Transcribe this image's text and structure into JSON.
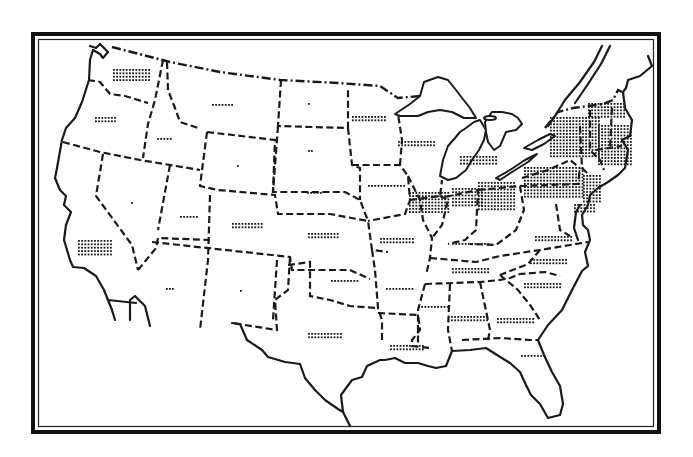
{
  "map": {
    "title": "",
    "type": "dot-density",
    "subject": "United States, state boundaries with dot-density shading",
    "colors": {
      "ink": "#1a1a1a",
      "paper": "#ffffff"
    },
    "frame": {
      "outer": [
        32,
        33,
        628,
        400
      ],
      "inner": [
        38,
        39,
        616,
        388
      ]
    },
    "states": [
      {
        "id": "WA",
        "name": "Washington",
        "density": "medium",
        "dots": [
          [
            113,
            69,
            12,
            4,
            3.2,
            3.4
          ]
        ]
      },
      {
        "id": "OR",
        "name": "Oregon",
        "density": "low",
        "dots": [
          [
            95,
            117,
            7,
            2,
            3.2,
            3.4
          ]
        ]
      },
      {
        "id": "ID",
        "name": "Idaho",
        "density": "very-low",
        "dots": [
          [
            157,
            138,
            5,
            1,
            3.2,
            3
          ]
        ]
      },
      {
        "id": "MT",
        "name": "Montana",
        "density": "very-low",
        "dots": [
          [
            212,
            104,
            7,
            1,
            3.2,
            3
          ]
        ]
      },
      {
        "id": "ND",
        "name": "North Dakota",
        "density": "trace",
        "dots": [
          [
            308,
            103,
            1,
            1,
            3,
            3
          ]
        ]
      },
      {
        "id": "WY",
        "name": "Wyoming",
        "density": "trace",
        "dots": [
          [
            237,
            165,
            1,
            1,
            3,
            3
          ]
        ]
      },
      {
        "id": "SD",
        "name": "South Dakota",
        "density": "trace",
        "dots": [
          [
            308,
            150,
            2,
            1,
            3,
            3
          ]
        ]
      },
      {
        "id": "NV",
        "name": "Nevada",
        "density": "trace",
        "dots": [
          [
            131,
            202,
            1,
            1,
            3,
            3
          ]
        ]
      },
      {
        "id": "UT",
        "name": "Utah",
        "density": "very-low",
        "dots": [
          [
            180,
            216,
            6,
            1,
            3.2,
            3
          ]
        ]
      },
      {
        "id": "CO",
        "name": "Colorado",
        "density": "low",
        "dots": [
          [
            232,
            223,
            10,
            2,
            3.2,
            3.4
          ]
        ]
      },
      {
        "id": "NE",
        "name": "Nebraska",
        "density": "very-low",
        "dots": [
          [
            307,
            192,
            5,
            1,
            3.2,
            3
          ]
        ]
      },
      {
        "id": "KS",
        "name": "Kansas",
        "density": "low",
        "dots": [
          [
            308,
            233,
            10,
            2,
            3.2,
            3.4
          ]
        ]
      },
      {
        "id": "CA",
        "name": "California",
        "density": "medium",
        "dots": [
          [
            78,
            240,
            11,
            5,
            3.2,
            3.4
          ]
        ]
      },
      {
        "id": "AZ",
        "name": "Arizona",
        "density": "trace",
        "dots": [
          [
            166,
            288,
            3,
            1,
            3,
            3
          ]
        ]
      },
      {
        "id": "NM",
        "name": "New Mexico",
        "density": "trace",
        "dots": [
          [
            240,
            290,
            1,
            1,
            3,
            3
          ]
        ]
      },
      {
        "id": "OK",
        "name": "Oklahoma",
        "density": "very-low",
        "dots": [
          [
            331,
            280,
            9,
            1,
            3.2,
            3
          ]
        ]
      },
      {
        "id": "TX",
        "name": "Texas",
        "density": "low",
        "dots": [
          [
            308,
            333,
            11,
            2,
            3.2,
            3.4
          ]
        ]
      },
      {
        "id": "MN",
        "name": "Minnesota",
        "density": "low",
        "dots": [
          [
            352,
            116,
            11,
            2,
            3.2,
            3.4
          ]
        ]
      },
      {
        "id": "IA",
        "name": "Iowa",
        "density": "low",
        "dots": [
          [
            368,
            185,
            12,
            1,
            3.2,
            3
          ]
        ]
      },
      {
        "id": "MO",
        "name": "Missouri",
        "density": "low",
        "dots": [
          [
            380,
            238,
            11,
            2,
            3.2,
            3.4
          ]
        ]
      },
      {
        "id": "AR",
        "name": "Arkansas",
        "density": "low",
        "dots": [
          [
            386,
            288,
            9,
            1,
            3.2,
            3
          ]
        ]
      },
      {
        "id": "LA",
        "name": "Louisiana",
        "density": "low",
        "dots": [
          [
            390,
            345,
            11,
            2,
            3.2,
            3.4
          ]
        ]
      },
      {
        "id": "WI",
        "name": "Wisconsin",
        "density": "medium",
        "dots": [
          [
            398,
            141,
            12,
            2,
            3.2,
            3.4
          ]
        ]
      },
      {
        "id": "IL",
        "name": "Illinois",
        "density": "high",
        "dots": [
          [
            409,
            192,
            13,
            7,
            3.2,
            3.2
          ]
        ]
      },
      {
        "id": "MI",
        "name": "Michigan",
        "density": "medium",
        "dots": [
          [
            460,
            156,
            12,
            3,
            3.2,
            3.4
          ]
        ]
      },
      {
        "id": "IN",
        "name": "Indiana",
        "density": "high",
        "dots": [
          [
            452,
            188,
            10,
            6,
            3.2,
            3.3
          ]
        ]
      },
      {
        "id": "OH",
        "name": "Ohio",
        "density": "high",
        "dots": [
          [
            478,
            182,
            12,
            9,
            3.2,
            3.3
          ]
        ]
      },
      {
        "id": "KY",
        "name": "Kentucky",
        "density": "low",
        "dots": [
          [
            452,
            243,
            12,
            1,
            3.2,
            3
          ]
        ]
      },
      {
        "id": "TN",
        "name": "Tennessee",
        "density": "low",
        "dots": [
          [
            452,
            268,
            12,
            2,
            3.2,
            3.4
          ]
        ]
      },
      {
        "id": "MS",
        "name": "Mississippi",
        "density": "low",
        "dots": [
          [
            418,
            306,
            10,
            1,
            3.2,
            3
          ]
        ]
      },
      {
        "id": "AL",
        "name": "Alabama",
        "density": "low",
        "dots": [
          [
            451,
            316,
            12,
            2,
            3.2,
            3.4
          ]
        ]
      },
      {
        "id": "GA",
        "name": "Georgia",
        "density": "low",
        "dots": [
          [
            497,
            318,
            12,
            2,
            3.2,
            3.4
          ]
        ]
      },
      {
        "id": "FL",
        "name": "Florida",
        "density": "very-low",
        "dots": [
          [
            521,
            355,
            8,
            1,
            3.2,
            3
          ]
        ]
      },
      {
        "id": "SC",
        "name": "South Carolina",
        "density": "low",
        "dots": [
          [
            524,
            283,
            12,
            2,
            3.2,
            3.4
          ]
        ]
      },
      {
        "id": "NC",
        "name": "North Carolina",
        "density": "low",
        "dots": [
          [
            530,
            259,
            12,
            2,
            3.2,
            3.4
          ]
        ]
      },
      {
        "id": "VA",
        "name": "Virginia",
        "density": "low",
        "dots": [
          [
            535,
            236,
            12,
            2,
            3.2,
            3.4
          ]
        ]
      },
      {
        "id": "PA",
        "name": "Pennsylvania",
        "density": "very-high",
        "dots": [
          [
            524,
            167,
            19,
            10,
            3.2,
            3.2
          ]
        ]
      },
      {
        "id": "NY",
        "name": "New York",
        "density": "very-high",
        "dots": [
          [
            550,
            117,
            16,
            13,
            3.2,
            3.2
          ]
        ]
      },
      {
        "id": "NJ",
        "name": "New Jersey",
        "density": "high",
        "dots": [
          [
            583,
            175,
            6,
            9,
            3.2,
            3.2
          ]
        ]
      },
      {
        "id": "MA",
        "name": "Massachusetts/CT/RI",
        "density": "very-high",
        "dots": [
          [
            598,
            125,
            11,
            13,
            3.2,
            3.2
          ]
        ]
      },
      {
        "id": "VT",
        "name": "Vermont/NH",
        "density": "high",
        "dots": [
          [
            588,
            103,
            12,
            5,
            3.2,
            3.2
          ]
        ]
      },
      {
        "id": "MD",
        "name": "Maryland/Delaware",
        "density": "medium",
        "dots": [
          [
            574,
            204,
            7,
            3,
            3.2,
            3.3
          ]
        ]
      }
    ]
  }
}
